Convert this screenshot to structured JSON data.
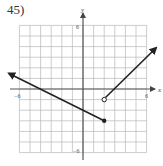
{
  "problem": {
    "number": "45)"
  },
  "graph": {
    "x_axis_label": "x",
    "y_axis_label": "y",
    "x_min_label": "−6",
    "x_max_label": "6",
    "y_max_label": "6",
    "y_min_label": "−6",
    "range": [
      -6,
      6
    ],
    "grid_step": 1,
    "colors": {
      "grid": "#b8b8b8",
      "axis": "#444444",
      "curve": "#222222"
    },
    "pieces": [
      {
        "name": "left-ray",
        "equation": "y = -0.5x - 2",
        "from": [
          2,
          -3
        ],
        "endpoint": "closed",
        "direction": "left-arrow"
      },
      {
        "name": "right-ray",
        "equation": "y = x - 3",
        "from": [
          2,
          -1
        ],
        "endpoint": "open",
        "direction": "right-arrow"
      }
    ]
  }
}
